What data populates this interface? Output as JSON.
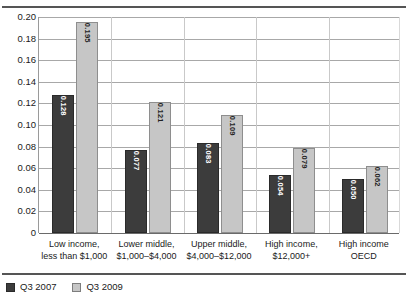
{
  "chart_data": {
    "type": "bar",
    "title": "",
    "subtitle": "",
    "xlabel": "",
    "ylabel": "",
    "ylim": [
      0,
      0.2
    ],
    "grid": true,
    "legend_position": "bottom-left",
    "y_ticks": [
      "0.20",
      "0.18",
      "0.16",
      "0.14",
      "0.12",
      "0.10",
      "0.08",
      "0.06",
      "0.04",
      "0.02",
      "0"
    ],
    "y_tick_values": [
      0.2,
      0.18,
      0.16,
      0.14,
      0.12,
      0.1,
      0.08,
      0.06,
      0.04,
      0.02,
      0
    ],
    "categories": [
      "Low income,\nless than $1,000",
      "Lower middle,\n$1,000–$4,000",
      "Upper middle,\n$4,000–$12,000",
      "High income,\n$12,000+",
      "High income\nOECD"
    ],
    "category_lines": [
      [
        "Low income,",
        "less than $1,000"
      ],
      [
        "Lower middle,",
        "$1,000–$4,000"
      ],
      [
        "Upper middle,",
        "$4,000–$12,000"
      ],
      [
        "High income,",
        "$12,000+"
      ],
      [
        "High income",
        "OECD"
      ]
    ],
    "series": [
      {
        "name": "Q3 2007",
        "color": "#3c3c3c",
        "values": [
          0.128,
          0.077,
          0.083,
          0.054,
          0.05
        ],
        "labels": [
          "0.128",
          "0.077",
          "0.083",
          "0.054",
          "0.050"
        ]
      },
      {
        "name": "Q3 2009",
        "color": "#c6c6c6",
        "values": [
          0.195,
          0.121,
          0.109,
          0.079,
          0.062
        ],
        "labels": [
          "0.195",
          "0.121",
          "0.109",
          "0.079",
          "0.062"
        ]
      }
    ]
  },
  "legend": {
    "items": [
      {
        "label": "Q3 2007",
        "swatch": "dark"
      },
      {
        "label": "Q3 2009",
        "swatch": "light"
      }
    ]
  }
}
